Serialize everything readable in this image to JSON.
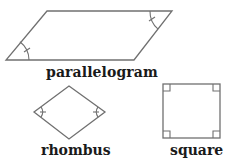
{
  "figure": {
    "shapes": [
      {
        "id": "parallelogram",
        "label": "parallelogram",
        "vertices": [
          [
            47,
            11
          ],
          [
            172,
            11
          ],
          [
            134,
            60
          ],
          [
            6,
            60
          ]
        ],
        "angle_marks": [
          "bottom-left",
          "top-right"
        ]
      },
      {
        "id": "rhombus",
        "label": "rhombus",
        "vertices": [
          [
            69,
            86
          ],
          [
            105,
            112
          ],
          [
            69,
            139
          ],
          [
            34,
            112
          ]
        ],
        "angle_marks": [
          "left",
          "right"
        ]
      },
      {
        "id": "square",
        "label": "square",
        "vertices": [
          [
            163,
            84
          ],
          [
            220,
            84
          ],
          [
            220,
            138
          ],
          [
            163,
            138
          ]
        ],
        "angle_marks": [
          "right-angle-all-corners"
        ]
      }
    ],
    "colors": {
      "stroke": "#707070",
      "text": "#1a1a1a",
      "background": "#ffffff"
    }
  }
}
